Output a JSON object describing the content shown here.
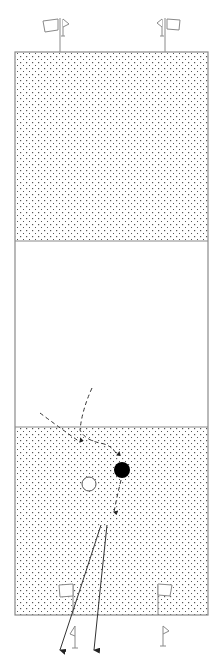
{
  "diagram": {
    "type": "field-play-diagram",
    "colors": {
      "line": "#8a8a8a",
      "dots": "#555555",
      "ink": "#222222",
      "ball_fill": "#000000",
      "background": "#ffffff"
    },
    "field": {
      "x": 15,
      "y": 52,
      "width": 193,
      "height": 563
    },
    "zones": [
      {
        "name": "top-zone",
        "pattern": "dotted",
        "y_start": 52,
        "y_end": 241
      },
      {
        "name": "middle-zone",
        "pattern": "blank",
        "y_start": 241,
        "y_end": 427
      },
      {
        "name": "bottom-zone",
        "pattern": "dotted",
        "y_start": 427,
        "y_end": 615
      }
    ],
    "flags": [
      {
        "name": "top-left-flag-pair",
        "x": 60,
        "y_base": 52,
        "y_top": 18
      },
      {
        "name": "top-right-flag-pair",
        "x": 165,
        "y_base": 52,
        "y_top": 18
      },
      {
        "name": "bottom-left-inner-flag",
        "x": 60,
        "y_base": 615,
        "y_top": 584
      },
      {
        "name": "bottom-right-inner-flag",
        "x": 160,
        "y_base": 615,
        "y_top": 584
      },
      {
        "name": "bottom-left-outer-flag",
        "x": 75,
        "y_base": 648,
        "y_top": 625
      },
      {
        "name": "bottom-right-outer-flag",
        "x": 163,
        "y_base": 646,
        "y_top": 625
      }
    ],
    "balls": [
      {
        "name": "open-ball",
        "cx": 89,
        "cy": 484,
        "r": 7,
        "filled": false
      },
      {
        "name": "filled-ball",
        "cx": 122,
        "cy": 470,
        "r": 8,
        "filled": true
      }
    ],
    "paths": [
      {
        "name": "dashed-path-left",
        "style": "dashed"
      },
      {
        "name": "dashed-path-upper",
        "style": "dashed"
      },
      {
        "name": "dashed-path-to-filled-ball",
        "style": "dashed"
      },
      {
        "name": "dashed-path-down-from-filled-ball",
        "style": "dashed"
      },
      {
        "name": "solid-arrow-left",
        "style": "solid",
        "end": [
          60,
          650
        ]
      },
      {
        "name": "solid-arrow-right",
        "style": "solid",
        "end": [
          94,
          650
        ]
      }
    ]
  }
}
